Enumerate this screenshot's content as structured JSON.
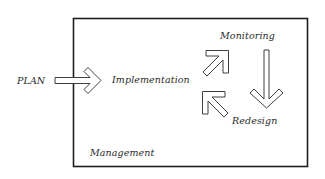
{
  "diagram": {
    "type": "process-flow",
    "colors": {
      "stroke": "#1e1e1e",
      "text": "#2a2a2a",
      "background": "#ffffff"
    },
    "container": {
      "label": "Management"
    },
    "nodes": {
      "plan": "PLAN",
      "implementation": "Implementation",
      "monitoring": "Monitoring",
      "redesign": "Redesign",
      "management": "Management"
    },
    "edges": [
      {
        "from": "PLAN",
        "to": "Implementation",
        "icon": "arrow-right-icon"
      },
      {
        "from": "Implementation",
        "to": "Monitoring",
        "icon": "arrow-up-right-icon"
      },
      {
        "from": "Monitoring",
        "to": "Redesign",
        "icon": "arrow-down-icon"
      },
      {
        "from": "Redesign",
        "to": "Implementation",
        "icon": "arrow-up-left-icon"
      }
    ]
  }
}
